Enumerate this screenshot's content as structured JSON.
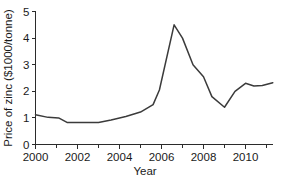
{
  "chart_data": {
    "type": "line",
    "title": "",
    "xlabel": "Year",
    "ylabel": "Price of zinc ($1000/tonne)",
    "xlim": [
      2000,
      2011.3
    ],
    "ylim": [
      0,
      5
    ],
    "xticks": [
      2000,
      2002,
      2004,
      2006,
      2008,
      2010
    ],
    "xtick_labels": [
      "2000",
      "2002",
      "2004",
      "2006",
      "2008",
      "2010"
    ],
    "xticks_minor": [
      2001,
      2003,
      2005,
      2007,
      2009,
      2011
    ],
    "yticks": [
      0,
      1,
      2,
      3,
      4,
      5
    ],
    "ytick_labels": [
      "0",
      "1",
      "2",
      "3",
      "4",
      "5"
    ],
    "grid": false,
    "legend": false,
    "legend_position": "none",
    "line_color": "#3b3b3b",
    "axis_color": "#2b2b2b",
    "series": [
      {
        "name": "Price of zinc",
        "x": [
          2000.0,
          2000.6,
          2001.1,
          2001.5,
          2003.0,
          2003.6,
          2004.3,
          2005.0,
          2005.6,
          2005.9,
          2006.6,
          2007.0,
          2007.5,
          2008.0,
          2008.4,
          2009.0,
          2009.5,
          2010.0,
          2010.4,
          2010.8,
          2011.3
        ],
        "y": [
          1.12,
          1.02,
          1.0,
          0.83,
          0.83,
          0.92,
          1.05,
          1.22,
          1.5,
          2.05,
          4.5,
          4.0,
          3.0,
          2.55,
          1.8,
          1.4,
          2.0,
          2.3,
          2.2,
          2.22,
          2.32
        ]
      }
    ]
  }
}
